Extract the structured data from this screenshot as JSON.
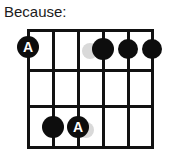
{
  "caption": {
    "text": "Because:"
  },
  "diagram": {
    "name": "guitar-chord-diagram",
    "type": "fretboard",
    "string_count": 6,
    "fret_line_count": 4,
    "colors": {
      "line": "#111111",
      "dot_filled": "#0d0d0d",
      "dot_ghost": "#d9d9d9",
      "dot_label_text": "#ffffff",
      "background": "#ffffff",
      "caption_text": "#1b1b1b"
    },
    "geometry": {
      "left": 28,
      "right": 152,
      "top": 30,
      "bottom": 147,
      "string_x": [
        28,
        53,
        78,
        103,
        128,
        152
      ],
      "fret_y": [
        30,
        70,
        106,
        147
      ],
      "line_thickness": 3
    },
    "markers": [
      {
        "id": "marker-1",
        "label": "A",
        "kind": "label",
        "string": 1,
        "x": 28,
        "y": 47,
        "radius": 11
      },
      {
        "id": "marker-2",
        "label": "",
        "kind": "ghost",
        "string": 0,
        "x": 90,
        "y": 51,
        "radius": 8
      },
      {
        "id": "marker-3",
        "label": "",
        "kind": "filled",
        "string": 4,
        "x": 103,
        "y": 49,
        "radius": 11
      },
      {
        "id": "marker-4",
        "label": "",
        "kind": "filled",
        "string": 5,
        "x": 128,
        "y": 49,
        "radius": 10
      },
      {
        "id": "marker-5",
        "label": "",
        "kind": "filled",
        "string": 6,
        "x": 152,
        "y": 49,
        "radius": 10
      },
      {
        "id": "marker-6",
        "label": "",
        "kind": "filled",
        "string": 2,
        "x": 53,
        "y": 127,
        "radius": 11
      },
      {
        "id": "marker-7",
        "label": "",
        "kind": "ghost",
        "string": 0,
        "x": 86,
        "y": 130,
        "radius": 8
      },
      {
        "id": "marker-8",
        "label": "A",
        "kind": "label",
        "string": 3,
        "x": 78,
        "y": 127,
        "radius": 11
      }
    ]
  }
}
